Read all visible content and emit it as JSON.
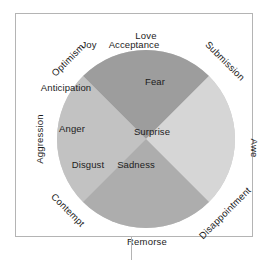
{
  "diagram": {
    "type": "plutchik-emotion-wheel",
    "colors": {
      "background": "#ffffff",
      "frame_border": "#b4b4b4",
      "connector_line": "#b4b4b4",
      "wheel_base": "#c9c9c9",
      "wedge_top": "#9d9d9d",
      "wedge_left": "#c2c2c2",
      "wedge_right": "#d6d6d6",
      "wedge_bottom": "#adadad",
      "label_text": "#1c1c1c"
    },
    "inner_labels": [
      {
        "text": "Joy",
        "x": 73,
        "y": 31
      },
      {
        "text": "Acceptance",
        "x": 118,
        "y": 31
      },
      {
        "text": "Anticipation",
        "x": 50,
        "y": 74
      },
      {
        "text": "Fear",
        "x": 139,
        "y": 68
      },
      {
        "text": "Anger",
        "x": 56,
        "y": 115
      },
      {
        "text": "Surprise",
        "x": 136,
        "y": 118
      },
      {
        "text": "Disgust",
        "x": 72,
        "y": 151
      },
      {
        "text": "Sadness",
        "x": 120,
        "y": 151
      }
    ],
    "outer_labels": [
      {
        "text": "Love",
        "x": 130,
        "y": 22,
        "rotation": "rot-zero"
      },
      {
        "text": "Optimism",
        "x": 52,
        "y": 46,
        "rotation": "rot-neg45"
      },
      {
        "text": "Submission",
        "x": 209,
        "y": 47,
        "rotation": "rot-pos45"
      },
      {
        "text": "Aggression",
        "x": 24,
        "y": 125,
        "rotation": "rot-neg90"
      },
      {
        "text": "Awe",
        "x": 238,
        "y": 134,
        "rotation": "rot-pos90"
      },
      {
        "text": "Contempt",
        "x": 52,
        "y": 196,
        "rotation": "rot-pos45"
      },
      {
        "text": "Disappointment",
        "x": 209,
        "y": 199,
        "rotation": "rot-neg45"
      },
      {
        "text": "Remorse",
        "x": 131,
        "y": 228,
        "rotation": "rot-zero"
      }
    ]
  }
}
